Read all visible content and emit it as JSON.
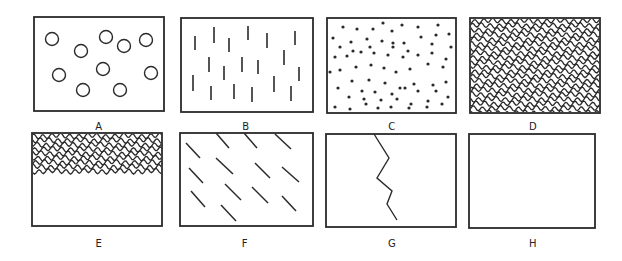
{
  "figure": {
    "stroke_color": "#2a2a2a",
    "background": "#ffffff"
  },
  "panels": [
    {
      "id": "A",
      "label": "A",
      "pattern": "circles",
      "box": [
        34,
        17,
        130,
        94
      ],
      "label_pos": [
        99,
        128
      ]
    },
    {
      "id": "B",
      "label": "B",
      "pattern": "vertical-dashes",
      "box": [
        181,
        18,
        132,
        94
      ],
      "label_pos": [
        246,
        128
      ]
    },
    {
      "id": "C",
      "label": "C",
      "pattern": "dots",
      "box": [
        327,
        18,
        129,
        95
      ],
      "label_pos": [
        392,
        128
      ]
    },
    {
      "id": "D",
      "label": "D",
      "pattern": "wavy-lines-full",
      "box": [
        470,
        18,
        130,
        95
      ],
      "label_pos": [
        533,
        128
      ]
    },
    {
      "id": "E",
      "label": "E",
      "pattern": "wavy-lines-top-half",
      "box": [
        32,
        133,
        130,
        93
      ],
      "label_pos": [
        99,
        245
      ]
    },
    {
      "id": "F",
      "label": "F",
      "pattern": "diagonal-dashes",
      "box": [
        180,
        133,
        133,
        93
      ],
      "label_pos": [
        245,
        245
      ]
    },
    {
      "id": "G",
      "label": "G",
      "pattern": "zigzag-crack",
      "box": [
        326,
        134,
        130,
        93
      ],
      "label_pos": [
        392,
        245
      ]
    },
    {
      "id": "H",
      "label": "H",
      "pattern": "empty",
      "box": [
        469,
        134,
        126,
        94
      ],
      "label_pos": [
        533,
        245
      ]
    }
  ],
  "patterns": {
    "circles": [
      [
        52,
        39
      ],
      [
        81,
        51
      ],
      [
        106,
        37
      ],
      [
        124,
        46
      ],
      [
        146,
        40
      ],
      [
        59,
        75
      ],
      [
        103,
        69
      ],
      [
        151,
        73
      ],
      [
        83,
        90
      ],
      [
        120,
        90
      ]
    ],
    "circle_radius": 6.5,
    "vertical_dashes": [
      [
        195,
        36,
        50
      ],
      [
        214,
        27,
        43
      ],
      [
        229,
        38,
        52
      ],
      [
        248,
        26,
        40
      ],
      [
        267,
        33,
        48
      ],
      [
        295,
        31,
        45
      ],
      [
        209,
        57,
        72
      ],
      [
        224,
        66,
        80
      ],
      [
        242,
        57,
        72
      ],
      [
        258,
        60,
        74
      ],
      [
        284,
        50,
        65
      ],
      [
        299,
        67,
        81
      ],
      [
        193,
        75,
        91
      ],
      [
        211,
        86,
        100
      ],
      [
        234,
        84,
        99
      ],
      [
        252,
        87,
        102
      ],
      [
        274,
        76,
        92
      ],
      [
        291,
        86,
        101
      ]
    ],
    "dots": [
      [
        343,
        27
      ],
      [
        357,
        29
      ],
      [
        373,
        29
      ],
      [
        383,
        23
      ],
      [
        392,
        31
      ],
      [
        402,
        25
      ],
      [
        418,
        27
      ],
      [
        438,
        25
      ],
      [
        333,
        38
      ],
      [
        351,
        42
      ],
      [
        367,
        39
      ],
      [
        382,
        41
      ],
      [
        393,
        43
      ],
      [
        404,
        43
      ],
      [
        421,
        37
      ],
      [
        436,
        35
      ],
      [
        449,
        34
      ],
      [
        340,
        47
      ],
      [
        353,
        51
      ],
      [
        370,
        47
      ],
      [
        393,
        47
      ],
      [
        408,
        51
      ],
      [
        432,
        44
      ],
      [
        451,
        47
      ],
      [
        335,
        57
      ],
      [
        347,
        56
      ],
      [
        361,
        52
      ],
      [
        374,
        53
      ],
      [
        388,
        55
      ],
      [
        403,
        57
      ],
      [
        418,
        55
      ],
      [
        432,
        53
      ],
      [
        446,
        59
      ],
      [
        330,
        72
      ],
      [
        340,
        70
      ],
      [
        356,
        67
      ],
      [
        371,
        65
      ],
      [
        384,
        68
      ],
      [
        396,
        72
      ],
      [
        410,
        69
      ],
      [
        428,
        64
      ],
      [
        443,
        67
      ],
      [
        352,
        81
      ],
      [
        369,
        80
      ],
      [
        385,
        83
      ],
      [
        400,
        88
      ],
      [
        414,
        84
      ],
      [
        433,
        85
      ],
      [
        446,
        82
      ],
      [
        338,
        88
      ],
      [
        362,
        91
      ],
      [
        375,
        92
      ],
      [
        392,
        94
      ],
      [
        405,
        88
      ],
      [
        418,
        91
      ],
      [
        436,
        91
      ],
      [
        448,
        97
      ],
      [
        349,
        97
      ],
      [
        364,
        99
      ],
      [
        381,
        100
      ],
      [
        397,
        99
      ],
      [
        411,
        104
      ],
      [
        428,
        101
      ],
      [
        442,
        104
      ],
      [
        335,
        107
      ],
      [
        350,
        109
      ],
      [
        366,
        104
      ],
      [
        378,
        108
      ],
      [
        391,
        107
      ],
      [
        409,
        108
      ],
      [
        427,
        107
      ]
    ],
    "dot_radius": 1.6,
    "diagonal_dashes": [
      [
        186,
        143,
        200,
        158
      ],
      [
        216,
        133,
        229,
        148
      ],
      [
        244,
        133,
        257,
        148
      ],
      [
        275,
        134,
        291,
        149
      ],
      [
        189,
        168,
        203,
        183
      ],
      [
        216,
        158,
        233,
        174
      ],
      [
        255,
        163,
        270,
        178
      ],
      [
        282,
        167,
        299,
        182
      ],
      [
        191,
        191,
        205,
        207
      ],
      [
        225,
        184,
        241,
        200
      ],
      [
        252,
        187,
        268,
        203
      ],
      [
        282,
        196,
        296,
        211
      ],
      [
        221,
        205,
        236,
        221
      ]
    ],
    "zigzag": [
      [
        374,
        134
      ],
      [
        389,
        158
      ],
      [
        377,
        178
      ],
      [
        392,
        191
      ],
      [
        387,
        204
      ],
      [
        397,
        220
      ]
    ],
    "wavy_amplitude": 2.2,
    "wavy_wavelength": 9,
    "wavy_spacing_D": 4.6,
    "wavy_spacing_E": 4.4,
    "wavy_fill_E_bottom": 175
  }
}
